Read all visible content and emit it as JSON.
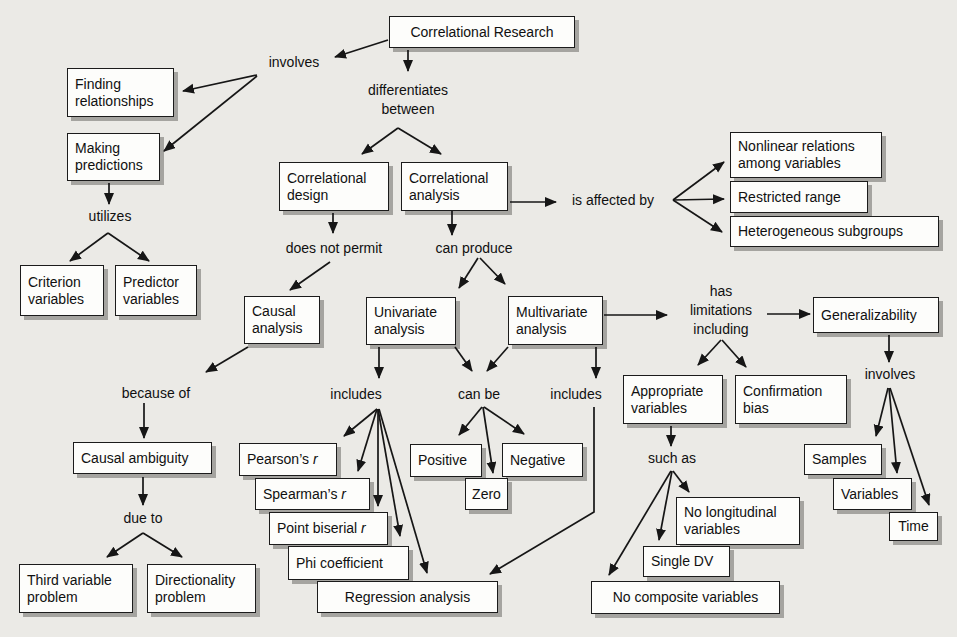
{
  "canvas": {
    "width": 957,
    "height": 637,
    "background": "#ebeae6",
    "node_fill": "#fdfdfb",
    "node_border": "#1b1b1b",
    "shadow_color": "#a5a4a0",
    "arrow_color": "#161616"
  },
  "nodes": [
    {
      "id": "correlational-research",
      "lines": [
        "Correlational Research"
      ],
      "x": 389,
      "y": 16,
      "w": 186,
      "h": 32,
      "align": "center"
    },
    {
      "id": "finding-relationships",
      "lines": [
        "Finding",
        "relationships"
      ],
      "x": 67,
      "y": 68,
      "w": 107,
      "h": 49
    },
    {
      "id": "making-predictions",
      "lines": [
        "Making",
        "predictions"
      ],
      "x": 67,
      "y": 133,
      "w": 93,
      "h": 48
    },
    {
      "id": "criterion-variables",
      "lines": [
        "Criterion",
        "variables"
      ],
      "x": 20,
      "y": 265,
      "w": 84,
      "h": 51
    },
    {
      "id": "predictor-variables",
      "lines": [
        "Predictor",
        "variables"
      ],
      "x": 115,
      "y": 265,
      "w": 82,
      "h": 51
    },
    {
      "id": "correlational-design",
      "lines": [
        "Correlational",
        "design"
      ],
      "x": 279,
      "y": 162,
      "w": 110,
      "h": 49
    },
    {
      "id": "correlational-analysis",
      "lines": [
        "Correlational",
        "analysis"
      ],
      "x": 401,
      "y": 162,
      "w": 107,
      "h": 49
    },
    {
      "id": "nonlinear-relations",
      "lines": [
        "Nonlinear relations",
        "among variables"
      ],
      "x": 730,
      "y": 132,
      "w": 152,
      "h": 46
    },
    {
      "id": "restricted-range",
      "lines": [
        "Restricted range"
      ],
      "x": 730,
      "y": 181,
      "w": 138,
      "h": 32
    },
    {
      "id": "heterogeneous-subgroups",
      "lines": [
        "Heterogeneous subgroups"
      ],
      "x": 730,
      "y": 216,
      "w": 209,
      "h": 31
    },
    {
      "id": "causal-analysis",
      "lines": [
        "Causal",
        "analysis"
      ],
      "x": 244,
      "y": 296,
      "w": 76,
      "h": 48
    },
    {
      "id": "univariate-analysis",
      "lines": [
        "Univariate",
        "analysis"
      ],
      "x": 366,
      "y": 297,
      "w": 90,
      "h": 48
    },
    {
      "id": "multivariate-analysis",
      "lines": [
        "Multivariate",
        "analysis"
      ],
      "x": 508,
      "y": 296,
      "w": 95,
      "h": 49
    },
    {
      "id": "generalizability",
      "lines": [
        "Generalizability"
      ],
      "x": 813,
      "y": 297,
      "w": 126,
      "h": 36
    },
    {
      "id": "causal-ambiguity",
      "lines": [
        "Causal ambiguity"
      ],
      "x": 73,
      "y": 442,
      "w": 139,
      "h": 32
    },
    {
      "id": "pearsons-r",
      "lines": [
        "Pearson’s r"
      ],
      "x": 239,
      "y": 443,
      "w": 98,
      "h": 33,
      "italic_tail": true
    },
    {
      "id": "spearmans-r",
      "lines": [
        "Spearman’s r"
      ],
      "x": 255,
      "y": 478,
      "w": 115,
      "h": 32,
      "italic_tail": true
    },
    {
      "id": "point-biserial-r",
      "lines": [
        "Point biserial r"
      ],
      "x": 269,
      "y": 512,
      "w": 119,
      "h": 33,
      "italic_tail": true
    },
    {
      "id": "phi-coefficient",
      "lines": [
        "Phi coefficient"
      ],
      "x": 288,
      "y": 546,
      "w": 121,
      "h": 34
    },
    {
      "id": "regression-analysis",
      "lines": [
        "Regression analysis"
      ],
      "x": 317,
      "y": 581,
      "w": 181,
      "h": 32,
      "align": "center"
    },
    {
      "id": "positive",
      "lines": [
        "Positive"
      ],
      "x": 410,
      "y": 444,
      "w": 72,
      "h": 33
    },
    {
      "id": "negative",
      "lines": [
        "Negative"
      ],
      "x": 502,
      "y": 443,
      "w": 81,
      "h": 34
    },
    {
      "id": "zero",
      "lines": [
        "Zero"
      ],
      "x": 465,
      "y": 478,
      "w": 43,
      "h": 32,
      "align": "center"
    },
    {
      "id": "appropriate-variables",
      "lines": [
        "Appropriate",
        "variables"
      ],
      "x": 623,
      "y": 375,
      "w": 100,
      "h": 49
    },
    {
      "id": "confirmation-bias",
      "lines": [
        "Confirmation",
        "bias"
      ],
      "x": 735,
      "y": 375,
      "w": 112,
      "h": 49
    },
    {
      "id": "samples",
      "lines": [
        "Samples"
      ],
      "x": 804,
      "y": 444,
      "w": 78,
      "h": 31
    },
    {
      "id": "variables",
      "lines": [
        "Variables"
      ],
      "x": 833,
      "y": 478,
      "w": 79,
      "h": 32
    },
    {
      "id": "time",
      "lines": [
        "Time"
      ],
      "x": 889,
      "y": 512,
      "w": 49,
      "h": 29,
      "align": "center"
    },
    {
      "id": "no-longitudinal-variables",
      "lines": [
        "No longitudinal",
        "variables"
      ],
      "x": 676,
      "y": 497,
      "w": 124,
      "h": 48
    },
    {
      "id": "single-dv",
      "lines": [
        "Single DV"
      ],
      "x": 643,
      "y": 546,
      "w": 87,
      "h": 31
    },
    {
      "id": "no-composite-variables",
      "lines": [
        "No composite variables"
      ],
      "x": 591,
      "y": 581,
      "w": 189,
      "h": 33,
      "align": "center"
    },
    {
      "id": "third-variable-problem",
      "lines": [
        "Third variable",
        "problem"
      ],
      "x": 19,
      "y": 564,
      "w": 114,
      "h": 49
    },
    {
      "id": "directionality-problem",
      "lines": [
        "Directionality",
        "problem"
      ],
      "x": 147,
      "y": 564,
      "w": 109,
      "h": 49
    }
  ],
  "labels": [
    {
      "id": "involves-left",
      "lines": [
        "involves"
      ],
      "cx": 294,
      "cy": 62
    },
    {
      "id": "differentiates-between",
      "lines": [
        "differentiates",
        "between"
      ],
      "cx": 408,
      "cy": 100
    },
    {
      "id": "utilizes",
      "lines": [
        "utilizes"
      ],
      "cx": 110,
      "cy": 216
    },
    {
      "id": "does-not-permit",
      "lines": [
        "does not permit"
      ],
      "cx": 334,
      "cy": 248
    },
    {
      "id": "can-produce",
      "lines": [
        "can produce"
      ],
      "cx": 474,
      "cy": 248
    },
    {
      "id": "is-affected-by",
      "lines": [
        "is affected by"
      ],
      "cx": 613,
      "cy": 200
    },
    {
      "id": "because-of",
      "lines": [
        "because of"
      ],
      "cx": 156,
      "cy": 393
    },
    {
      "id": "includes-left",
      "lines": [
        "includes"
      ],
      "cx": 356,
      "cy": 394
    },
    {
      "id": "can-be",
      "lines": [
        "can be"
      ],
      "cx": 479,
      "cy": 394
    },
    {
      "id": "includes-right",
      "lines": [
        "includes"
      ],
      "cx": 576,
      "cy": 394
    },
    {
      "id": "has-limitations-including",
      "lines": [
        "has",
        "limitations",
        "including"
      ],
      "cx": 721,
      "cy": 310
    },
    {
      "id": "such-as",
      "lines": [
        "such as"
      ],
      "cx": 672,
      "cy": 458
    },
    {
      "id": "involves-right",
      "lines": [
        "involves"
      ],
      "cx": 890,
      "cy": 374
    },
    {
      "id": "due-to",
      "lines": [
        "due to"
      ],
      "cx": 143,
      "cy": 518
    }
  ],
  "arrows": [
    {
      "id": "research-involves",
      "points": [
        [
          388,
          40
        ],
        [
          335,
          57
        ]
      ]
    },
    {
      "id": "involves-finding",
      "points": [
        [
          257,
          75
        ],
        [
          183,
          91
        ]
      ]
    },
    {
      "id": "involves-making",
      "points": [
        [
          257,
          76
        ],
        [
          164,
          151
        ]
      ]
    },
    {
      "id": "research-differentiates",
      "points": [
        [
          408,
          50
        ],
        [
          408,
          71
        ]
      ]
    },
    {
      "id": "differentiates-design",
      "points": [
        [
          398,
          128
        ],
        [
          362,
          154
        ]
      ]
    },
    {
      "id": "differentiates-analysis",
      "points": [
        [
          398,
          128
        ],
        [
          441,
          154
        ]
      ]
    },
    {
      "id": "making-utilizes",
      "points": [
        [
          109,
          183
        ],
        [
          109,
          204
        ]
      ]
    },
    {
      "id": "utilizes-criterion",
      "points": [
        [
          108,
          233
        ],
        [
          70,
          261
        ]
      ]
    },
    {
      "id": "utilizes-predictor",
      "points": [
        [
          108,
          233
        ],
        [
          149,
          261
        ]
      ]
    },
    {
      "id": "design-permit",
      "points": [
        [
          333,
          213
        ],
        [
          333,
          233
        ]
      ]
    },
    {
      "id": "permit-causal",
      "points": [
        [
          330,
          262
        ],
        [
          290,
          290
        ]
      ]
    },
    {
      "id": "analysis-produce",
      "points": [
        [
          452,
          211
        ],
        [
          452,
          235
        ]
      ]
    },
    {
      "id": "analysis-affected",
      "points": [
        [
          510,
          202
        ],
        [
          556,
          202
        ]
      ]
    },
    {
      "id": "affected-nonlinear",
      "points": [
        [
          673,
          200
        ],
        [
          724,
          162
        ]
      ]
    },
    {
      "id": "affected-restricted",
      "points": [
        [
          673,
          200
        ],
        [
          724,
          199
        ]
      ]
    },
    {
      "id": "affected-heterogeneous",
      "points": [
        [
          673,
          200
        ],
        [
          722,
          232
        ]
      ]
    },
    {
      "id": "produce-univariate",
      "points": [
        [
          478,
          258
        ],
        [
          459,
          288
        ]
      ]
    },
    {
      "id": "produce-multivariate",
      "points": [
        [
          480,
          258
        ],
        [
          505,
          284
        ]
      ]
    },
    {
      "id": "univariate-includes",
      "points": [
        [
          379,
          347
        ],
        [
          379,
          378
        ]
      ]
    },
    {
      "id": "univariate-canbe",
      "points": [
        [
          455,
          347
        ],
        [
          472,
          371
        ]
      ]
    },
    {
      "id": "multivariate-canbe",
      "points": [
        [
          508,
          347
        ],
        [
          487,
          371
        ]
      ]
    },
    {
      "id": "multivariate-includes",
      "points": [
        [
          596,
          347
        ],
        [
          596,
          378
        ]
      ]
    },
    {
      "id": "multivariate-limitations",
      "points": [
        [
          604,
          315
        ],
        [
          667,
          315
        ]
      ]
    },
    {
      "id": "limitations-generalizability",
      "points": [
        [
          767,
          314
        ],
        [
          810,
          314
        ]
      ]
    },
    {
      "id": "includes-pearsons",
      "points": [
        [
          377,
          409
        ],
        [
          344,
          436
        ]
      ]
    },
    {
      "id": "includes-spearmans",
      "points": [
        [
          377,
          409
        ],
        [
          358,
          471
        ]
      ]
    },
    {
      "id": "includes-biserial",
      "points": [
        [
          378,
          409
        ],
        [
          378,
          506
        ]
      ]
    },
    {
      "id": "includes-phi",
      "points": [
        [
          378,
          409
        ],
        [
          400,
          536
        ]
      ]
    },
    {
      "id": "includes-regression",
      "points": [
        [
          379,
          409
        ],
        [
          427,
          573
        ]
      ]
    },
    {
      "id": "canbe-positive",
      "points": [
        [
          482,
          407
        ],
        [
          459,
          435
        ]
      ]
    },
    {
      "id": "canbe-zero",
      "points": [
        [
          483,
          407
        ],
        [
          493,
          473
        ]
      ]
    },
    {
      "id": "canbe-negative",
      "points": [
        [
          484,
          407
        ],
        [
          524,
          434
        ]
      ]
    },
    {
      "id": "includes2-regression",
      "points": [
        [
          594,
          407
        ],
        [
          594,
          512
        ],
        [
          490,
          574
        ]
      ]
    },
    {
      "id": "limitations-appropriate",
      "points": [
        [
          721,
          340
        ],
        [
          698,
          365
        ]
      ]
    },
    {
      "id": "limitations-confirmation",
      "points": [
        [
          722,
          340
        ],
        [
          746,
          367
        ]
      ]
    },
    {
      "id": "appropriate-suchas",
      "points": [
        [
          671,
          426
        ],
        [
          671,
          446
        ]
      ]
    },
    {
      "id": "suchas-longitudinal",
      "points": [
        [
          673,
          471
        ],
        [
          689,
          492
        ]
      ]
    },
    {
      "id": "suchas-singledv",
      "points": [
        [
          672,
          471
        ],
        [
          659,
          540
        ]
      ]
    },
    {
      "id": "suchas-composite",
      "points": [
        [
          671,
          471
        ],
        [
          609,
          575
        ]
      ]
    },
    {
      "id": "generalizability-involves",
      "points": [
        [
          889,
          335
        ],
        [
          889,
          362
        ]
      ]
    },
    {
      "id": "involves-samples",
      "points": [
        [
          888,
          388
        ],
        [
          876,
          436
        ]
      ]
    },
    {
      "id": "involves-variables",
      "points": [
        [
          889,
          388
        ],
        [
          897,
          473
        ]
      ]
    },
    {
      "id": "involves-time",
      "points": [
        [
          890,
          388
        ],
        [
          929,
          505
        ]
      ]
    },
    {
      "id": "causal-because",
      "points": [
        [
          248,
          347
        ],
        [
          206,
          372
        ]
      ]
    },
    {
      "id": "because-ambiguity",
      "points": [
        [
          144,
          403
        ],
        [
          144,
          438
        ]
      ]
    },
    {
      "id": "ambiguity-dueto",
      "points": [
        [
          143,
          477
        ],
        [
          143,
          505
        ]
      ]
    },
    {
      "id": "dueto-third",
      "points": [
        [
          143,
          533
        ],
        [
          107,
          557
        ]
      ]
    },
    {
      "id": "dueto-directionality",
      "points": [
        [
          143,
          533
        ],
        [
          182,
          557
        ]
      ]
    }
  ]
}
